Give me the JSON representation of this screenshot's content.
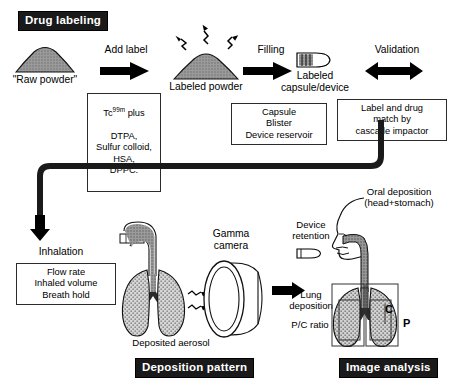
{
  "figure": {
    "title_top_banner": "Drug labeling",
    "banner_deposition": "Deposition pattern",
    "banner_image_analysis": "Image analysis"
  },
  "top_row": {
    "raw_powder_label": "\"Raw powder\"",
    "step1_label": "Add label",
    "labeled_powder_label": "Labeled powder",
    "step2_label": "Filling",
    "capsule_label": "Labeled\ncapsule/device",
    "step3_label": "Validation",
    "box_radiolabel": {
      "line1_prefix": "Tc",
      "line1_sup": "99m",
      "line1_suffix": " plus",
      "rest": "DTPA,\nSulfur colloid,\nHSA,\nDPPC."
    },
    "box_filling": "Capsule\nBlister\nDevice reservoir",
    "box_validation": "Label and drug\nmatch by\ncascade impactor"
  },
  "bottom_left": {
    "inhalation_label": "Inhalation",
    "box_inhalation": "Flow rate\nInhaled volume\nBreath hold",
    "gamma_camera_label": "Gamma\ncamera",
    "deposited_aerosol_label": "Deposited aerosol"
  },
  "bottom_right": {
    "oral_deposition_label": "Oral deposition\n(head+stomach)",
    "device_retention_label": "Device\nretention",
    "lung_deposition_label": "Lung\ndeposition",
    "pc_ratio_label": "P/C ratio",
    "roi_central": "C",
    "roi_peripheral": "P"
  },
  "colors": {
    "banner_bg": "#1a1a1a",
    "banner_text": "#ffffff",
    "ink": "#000000",
    "powder_fill": "#8c8c8c",
    "tissue_fill": "#b3b3b3",
    "lung_fill": "#c9c9c9",
    "airway_fill": "#8f8f8f",
    "roi_stroke": "#333333"
  }
}
